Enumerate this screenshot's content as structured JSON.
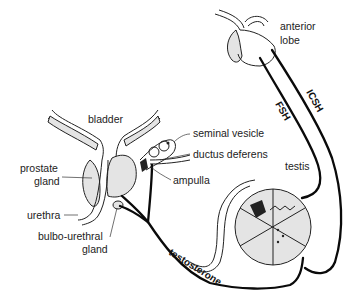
{
  "diagram": {
    "title": "",
    "labels": {
      "anterior_lobe_line1": "anterior",
      "anterior_lobe_line2": "lobe",
      "bladder": "bladder",
      "seminal_vesicle": "seminal vesicle",
      "ductus_deferens": "ductus deferens",
      "ampulla": "ampulla",
      "testis": "testis",
      "prostate_line1": "prostate",
      "prostate_line2": "gland",
      "urethra": "urethra",
      "bulbo_line1": "bulbo-urethral",
      "bulbo_line2": "gland"
    },
    "hormones": {
      "fsh": "FSH",
      "icsh": "ICSH",
      "testosterone": "testosterone"
    },
    "colors": {
      "line": "#0a0a0a",
      "text": "#222222",
      "shading": "#e4e4e4",
      "background": "#ffffff"
    }
  }
}
